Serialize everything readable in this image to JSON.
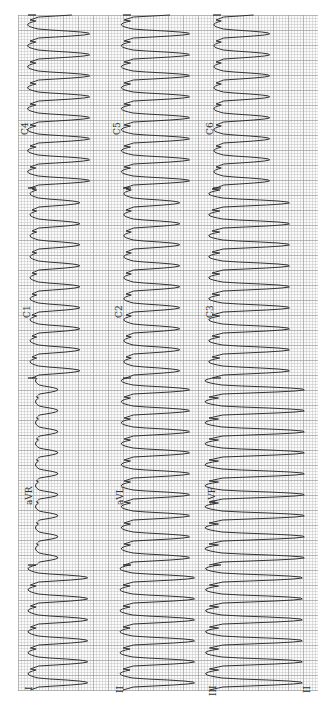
{
  "ecg": {
    "orientation": "rotated-90-ccw",
    "paper": {
      "grid_minor_color": "#bebebe",
      "grid_major_color": "#969696",
      "trace_color": "#333333"
    },
    "rows": [
      {
        "name": "row-1",
        "leads": [
          "I",
          "aVR",
          "C1",
          "C4"
        ]
      },
      {
        "name": "row-2",
        "leads": [
          "II",
          "aVL",
          "C2",
          "C5"
        ]
      },
      {
        "name": "row-3",
        "leads": [
          "III",
          "aVF",
          "C3",
          "C6"
        ]
      }
    ],
    "labels": {
      "I": "I",
      "II": "II",
      "III": "III",
      "aVR": "aVR",
      "aVL": "aVL",
      "aVF": "aVF",
      "C1": "C1",
      "C2": "C2",
      "C3": "C3",
      "C4": "C4",
      "C5": "C5",
      "C6": "C6"
    },
    "rhythm_strip_label": "II"
  }
}
